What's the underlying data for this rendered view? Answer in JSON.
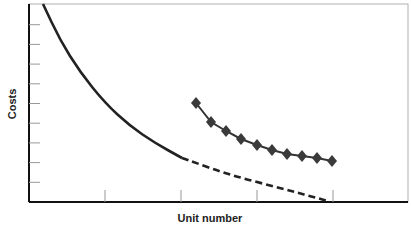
{
  "chart_data": {
    "type": "line",
    "title": "",
    "xlabel": "Unit number",
    "ylabel": "Costs",
    "grid": false,
    "legend": null,
    "x_ticks_count": 4,
    "y_ticks_count": 9,
    "tick_labels_shown": false,
    "series": [
      {
        "name": "cost-curve-solid",
        "style": "solid",
        "color": "#222222",
        "description": "Steeply decreasing learning-curve style cost line starting at top-left",
        "points_px": [
          [
            43,
            4
          ],
          [
            60,
            40
          ],
          [
            80,
            72
          ],
          [
            105,
            103
          ],
          [
            130,
            126
          ],
          [
            155,
            143
          ],
          [
            182,
            158
          ]
        ]
      },
      {
        "name": "cost-curve-projected",
        "style": "dashed",
        "color": "#222222",
        "description": "Dashed continuation of the cost curve toward the right",
        "points_px": [
          [
            182,
            158
          ],
          [
            230,
            175
          ],
          [
            280,
            188
          ],
          [
            328,
            201
          ]
        ]
      },
      {
        "name": "actual-costs-markers",
        "style": "solid-with-diamond-markers",
        "color": "#333333",
        "points_px": [
          [
            196,
            103
          ],
          [
            211,
            122
          ],
          [
            226,
            131
          ],
          [
            241,
            139
          ],
          [
            257,
            145
          ],
          [
            272,
            150
          ],
          [
            287,
            154
          ],
          [
            302,
            156
          ],
          [
            317,
            158
          ],
          [
            332,
            161
          ]
        ]
      }
    ]
  },
  "labels": {
    "y_axis": "Costs",
    "x_axis": "Unit number"
  }
}
